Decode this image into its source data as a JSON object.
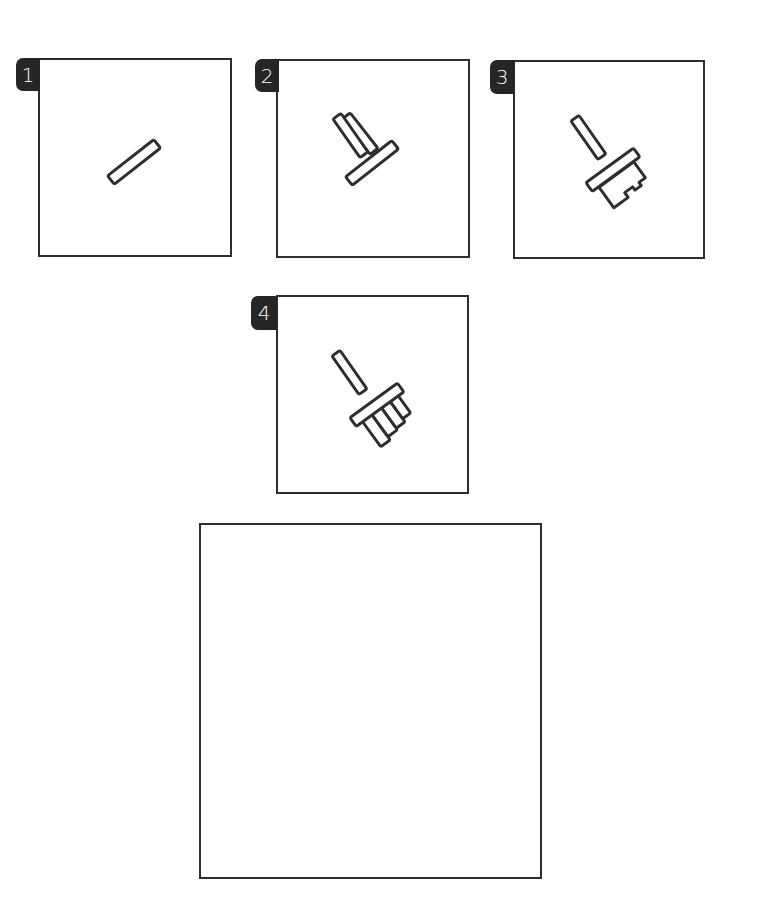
{
  "worksheet": {
    "type": "step-by-step drawing guide",
    "subject": "paint brush",
    "line_color": "#2e2e2e",
    "badge_color": "#262626",
    "steps": [
      {
        "number": "1",
        "description": "Draw a slanted rectangle (brush ferrule base)"
      },
      {
        "number": "2",
        "description": "Add a handle stick on top, forming a T shape"
      },
      {
        "number": "3",
        "description": "Add the brush head with a notched bottom edge"
      },
      {
        "number": "4",
        "description": "Split the brush head into separate bristle tufts"
      }
    ],
    "practice_box": {
      "label": ""
    }
  }
}
